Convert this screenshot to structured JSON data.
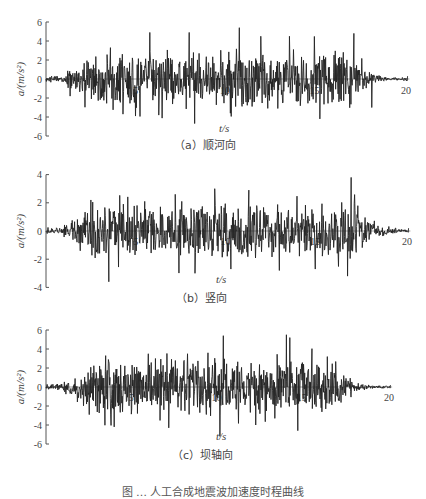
{
  "figure_caption": "图 … 人工合成地震波加速度时程曲线",
  "chart_data": [
    {
      "type": "line",
      "id": "a",
      "title": "（a）顺河向",
      "xlabel": "t/s",
      "ylabel": "a/(m/s²)",
      "xlim": [
        0,
        20
      ],
      "ylim": [
        -6,
        6
      ],
      "xticks": [
        5,
        10,
        15,
        20
      ],
      "yticks": [
        6,
        4,
        2,
        0,
        -2,
        -4,
        -6
      ],
      "grid": false,
      "legend": null,
      "series": [
        {
          "name": "acceleration",
          "seed": 11,
          "envelope": {
            "rise_end": 2.0,
            "decay_start": 17.0,
            "end": 20.2,
            "peak": 3.4
          },
          "key_points": [
            [
              0.0,
              0.0
            ],
            [
              3.6,
              3.3
            ],
            [
              4.3,
              -3.7
            ],
            [
              5.0,
              -3.9
            ],
            [
              5.8,
              4.9
            ],
            [
              6.3,
              -3.8
            ],
            [
              8.0,
              4.9
            ],
            [
              10.3,
              -3.6
            ],
            [
              10.8,
              5.4
            ],
            [
              12.0,
              4.5
            ],
            [
              13.6,
              4.5
            ],
            [
              15.3,
              -4.2
            ],
            [
              17.2,
              4.8
            ],
            [
              18.2,
              -3.0
            ],
            [
              20.2,
              0.3
            ]
          ]
        }
      ],
      "px": {
        "top": 12,
        "height": 142,
        "x0": 46,
        "x20": 404,
        "y0": 79,
        "ppu": 9.5,
        "xlabel_x": 225,
        "xlabel_y": 132,
        "caption_x": 188,
        "caption_y": 146,
        "tick_label_y": 94
      }
    },
    {
      "type": "line",
      "id": "b",
      "title": "（b）竖向",
      "xlabel": "t/s",
      "ylabel": "a/(m/s²)",
      "xlim": [
        0,
        20
      ],
      "ylim": [
        -4,
        4
      ],
      "xticks": [
        5,
        10,
        15,
        20
      ],
      "yticks": [
        4,
        2,
        0,
        -2,
        -4
      ],
      "grid": false,
      "legend": null,
      "series": [
        {
          "name": "acceleration",
          "seed": 29,
          "envelope": {
            "rise_end": 2.0,
            "decay_start": 17.5,
            "end": 20.2,
            "peak": 2.2
          },
          "key_points": [
            [
              0.0,
              0.0
            ],
            [
              2.5,
              2.2
            ],
            [
              3.5,
              -3.6
            ],
            [
              5.5,
              2.1
            ],
            [
              7.2,
              2.6
            ],
            [
              8.3,
              -3.0
            ],
            [
              9.4,
              3.0
            ],
            [
              11.3,
              2.9
            ],
            [
              10.3,
              -2.7
            ],
            [
              13.0,
              -2.8
            ],
            [
              15.0,
              -2.7
            ],
            [
              17.0,
              3.8
            ],
            [
              16.8,
              -3.2
            ],
            [
              20.2,
              0.2
            ]
          ]
        }
      ],
      "px": {
        "top": 163,
        "height": 140,
        "x0": 46,
        "x20": 405,
        "y0": 231,
        "ppu": 14.1,
        "xlabel_x": 222,
        "xlabel_y": 283,
        "caption_x": 190,
        "caption_y": 299,
        "tick_label_y": 245
      }
    },
    {
      "type": "line",
      "id": "c",
      "title": "（c）坝轴向",
      "xlabel": "t/s",
      "ylabel": "a/(m/s²)",
      "xlim": [
        0,
        20
      ],
      "ylim": [
        -6,
        6
      ],
      "xticks": [
        5,
        10,
        15,
        20
      ],
      "yticks": [
        6,
        4,
        2,
        0,
        -2,
        -4,
        -6
      ],
      "grid": false,
      "legend": null,
      "series": [
        {
          "name": "acceleration",
          "seed": 47,
          "envelope": {
            "rise_end": 2.0,
            "decay_start": 17.0,
            "end": 20.2,
            "peak": 3.2
          },
          "key_points": [
            [
              0.0,
              0.0
            ],
            [
              3.5,
              3.3
            ],
            [
              4.0,
              -4.2
            ],
            [
              6.0,
              3.5
            ],
            [
              7.2,
              -4.3
            ],
            [
              8.3,
              3.5
            ],
            [
              9.5,
              3.6
            ],
            [
              10.4,
              5.4
            ],
            [
              10.2,
              -5.2
            ],
            [
              14.1,
              5.5
            ],
            [
              14.3,
              5.2
            ],
            [
              16.5,
              3.2
            ],
            [
              12.3,
              -4.0
            ],
            [
              20.2,
              0.2
            ]
          ]
        }
      ],
      "px": {
        "top": 320,
        "height": 144,
        "x0": 46,
        "x20": 387,
        "y0": 387,
        "ppu": 9.5,
        "xlabel_x": 222,
        "xlabel_y": 440,
        "caption_x": 186,
        "caption_y": 456,
        "tick_label_y": 401
      }
    }
  ]
}
